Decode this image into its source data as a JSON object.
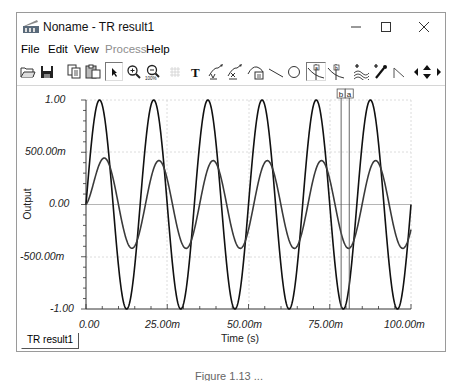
{
  "window": {
    "title": "Noname - TR result1",
    "controls": {
      "minimize": "—",
      "maximize": "☐",
      "close": "✕"
    }
  },
  "menu": {
    "items": [
      {
        "label": "File",
        "enabled": true
      },
      {
        "label": "Edit",
        "enabled": true
      },
      {
        "label": "View",
        "enabled": true
      },
      {
        "label": "Process",
        "enabled": false
      },
      {
        "label": "Help",
        "enabled": true
      }
    ]
  },
  "toolbar": {
    "buttons": [
      {
        "name": "open-icon"
      },
      {
        "name": "save-icon"
      },
      {
        "name": "copy-icon"
      },
      {
        "name": "paste-icon"
      },
      {
        "name": "select-arrow-icon",
        "pressed": true
      },
      {
        "name": "zoom-in-icon"
      },
      {
        "name": "zoom-100-icon"
      },
      {
        "name": "grid-icon",
        "enabled": false
      },
      {
        "name": "text-icon"
      },
      {
        "name": "curve-label-icon"
      },
      {
        "name": "curve-label-2-icon"
      },
      {
        "name": "slope-label-icon"
      },
      {
        "name": "line-icon"
      },
      {
        "name": "circle-icon"
      },
      {
        "name": "cursor-a-icon",
        "pressed": true
      },
      {
        "name": "cursor-b-icon"
      },
      {
        "name": "add-curve-icon"
      },
      {
        "name": "add-point-icon"
      },
      {
        "name": "step-icon"
      },
      {
        "name": "move-left-icon"
      },
      {
        "name": "move-up-down-icon"
      },
      {
        "name": "move-right-icon"
      }
    ]
  },
  "tabs": [
    {
      "label": "TR result1",
      "active": true
    }
  ],
  "caption": "Figure 1.13 ...",
  "colors": {
    "trace": "#111111",
    "trace2": "#3a3a3a",
    "grid": "#cfcfcf",
    "zero_line": "#b5b5b5",
    "cursor": "#555555"
  },
  "chart_data": {
    "type": "line",
    "title": "",
    "xlabel": "Time (s)",
    "ylabel": "Output",
    "xlim": [
      0,
      0.1
    ],
    "ylim": [
      -1,
      1
    ],
    "x_ticks": [
      "0.00",
      "25.00m",
      "50.00m",
      "75.00m",
      "100.00m"
    ],
    "y_ticks": [
      "1.00",
      "500.00m",
      "0.00",
      "-500.00m",
      "-1.00"
    ],
    "grid": true,
    "series": [
      {
        "name": "Input (sine)",
        "amplitude": 1.0,
        "frequency_hz": 60,
        "phase_deg": 0,
        "description": "Large sine wave, ~6 cycles over 100 ms, peaks at ±1.00"
      },
      {
        "name": "Output (filtered)",
        "amplitude": 0.42,
        "frequency_hz": 60,
        "phase_deg": -35,
        "initial_transient_peak": 0.33,
        "description": "Smaller sine with start-up transient, peaks at about ±420m"
      }
    ],
    "cursors": [
      {
        "label": "b",
        "x": 0.0785
      },
      {
        "label": "a",
        "x": 0.081
      }
    ]
  }
}
